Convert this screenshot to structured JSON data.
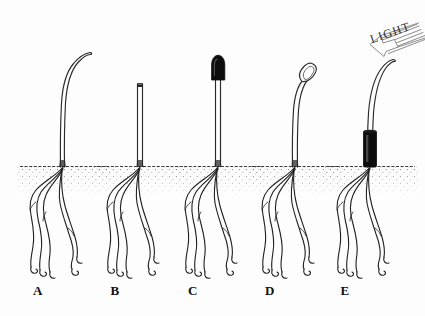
{
  "figure": {
    "title_visible": false,
    "background_color": "#fdfdfd",
    "ink_color": "#1a1a1a",
    "soil_color": "#4a4a4a",
    "cap_color": "#0d0d0d"
  },
  "light": {
    "label": "LIGHT",
    "direction": "down-left",
    "arrow_stripes": 6,
    "arrow_color": "#8c8c8c"
  },
  "specimens": [
    {
      "id": "A",
      "label": "A",
      "label_x": 33,
      "stem_x": 63,
      "treatment": "intact seedling",
      "tip_state": "intact curved tip",
      "tip_cap": "none",
      "collar": "none",
      "bends_toward_light": true,
      "stem_top_y": 52,
      "soil_y": 166
    },
    {
      "id": "B",
      "label": "B",
      "label_x": 110,
      "stem_x": 140,
      "treatment": "tip removed (decapitated)",
      "tip_state": "flat cut top",
      "tip_cap": "none",
      "collar": "none",
      "bends_toward_light": false,
      "stem_top_y": 83,
      "soil_y": 166
    },
    {
      "id": "C",
      "label": "C",
      "label_x": 188,
      "stem_x": 218,
      "treatment": "tip covered with opaque cap",
      "tip_state": "straight upright",
      "tip_cap": "opaque black cap",
      "collar": "none",
      "bends_toward_light": false,
      "stem_top_y": 58,
      "soil_y": 166
    },
    {
      "id": "D",
      "label": "D",
      "label_x": 265,
      "stem_x": 295,
      "treatment": "tip covered with transparent cap",
      "tip_state": "curved tip",
      "tip_cap": "transparent clear cap",
      "collar": "none",
      "bends_toward_light": true,
      "stem_top_y": 70,
      "soil_y": 166
    },
    {
      "id": "E",
      "label": "E",
      "label_x": 340,
      "stem_x": 370,
      "treatment": "base covered with opaque collar",
      "tip_state": "intact curved tip",
      "tip_cap": "none",
      "collar": "opaque black collar at base",
      "bends_toward_light": true,
      "stem_top_y": 60,
      "soil_y": 166
    }
  ],
  "labels_row_y": 290
}
